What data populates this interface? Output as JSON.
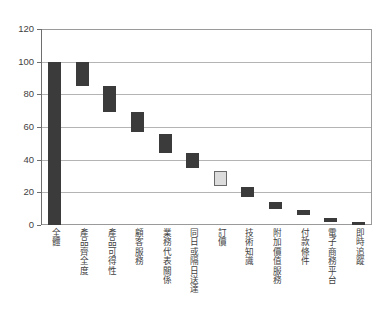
{
  "chart_data": {
    "type": "bar",
    "subtype": "waterfall",
    "title": "",
    "subtitle": "",
    "xlabel": "",
    "ylabel": "",
    "ylim": [
      0,
      120
    ],
    "ytick_values": [
      0,
      20,
      40,
      60,
      80,
      100,
      120
    ],
    "ytick_labels": [
      "0",
      "20",
      "40",
      "60",
      "80",
      "100",
      "120"
    ],
    "grid": true,
    "legend": "none",
    "categories": [
      "全體",
      "產品齊全度",
      "產品可得性",
      "顧客服務",
      "業務代表關係",
      "同日或隔日送達",
      "訂價",
      "技術知識",
      "附加價值服務",
      "付款條件",
      "電子商務平台",
      "即時追蹤"
    ],
    "bars": [
      {
        "category": "全體",
        "top": 100,
        "bottom": 0,
        "value": 100,
        "highlighted": false
      },
      {
        "category": "產品齊全度",
        "top": 100,
        "bottom": 85,
        "value": 15,
        "highlighted": false
      },
      {
        "category": "產品可得性",
        "top": 85,
        "bottom": 69,
        "value": 16,
        "highlighted": false
      },
      {
        "category": "顧客服務",
        "top": 69,
        "bottom": 57,
        "value": 12,
        "highlighted": false
      },
      {
        "category": "業務代表關係",
        "top": 56,
        "bottom": 44,
        "value": 12,
        "highlighted": false
      },
      {
        "category": "同日或隔日送達",
        "top": 44,
        "bottom": 35,
        "value": 9,
        "highlighted": false
      },
      {
        "category": "訂價",
        "top": 33,
        "bottom": 24,
        "value": 9,
        "highlighted": true
      },
      {
        "category": "技術知識",
        "top": 23,
        "bottom": 17,
        "value": 6,
        "highlighted": false
      },
      {
        "category": "附加價值服務",
        "top": 14,
        "bottom": 10,
        "value": 4,
        "highlighted": false
      },
      {
        "category": "付款條件",
        "top": 9,
        "bottom": 6,
        "value": 3,
        "highlighted": false
      },
      {
        "category": "電子商務平台",
        "top": 4,
        "bottom": 2,
        "value": 2,
        "highlighted": false
      },
      {
        "category": "即時追蹤",
        "top": 2,
        "bottom": 0,
        "value": 2,
        "highlighted": false
      }
    ],
    "colors": {
      "bar_dark": "#3b3b3b",
      "bar_highlight": "#dcdcdc",
      "bar_highlight_border": "#6a6a6a",
      "gridline": "#b4b4b4",
      "axis": "#6e6e6e",
      "plot_border": "#9a9a9a",
      "background": "#ffffff",
      "text": "#3f3f3f"
    }
  }
}
